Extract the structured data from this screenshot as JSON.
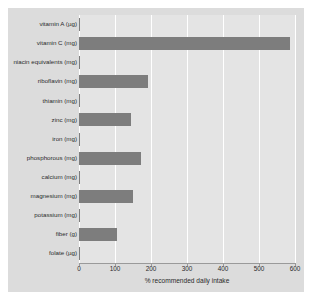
{
  "chart_data": {
    "type": "bar",
    "orientation": "horizontal",
    "title": "",
    "xlabel": "% recommended daily intake",
    "ylabel": "",
    "xlim": [
      0,
      600
    ],
    "xticks": [
      0,
      100,
      200,
      300,
      400,
      500,
      600
    ],
    "grid": true,
    "legend": null,
    "categories": [
      "vitamin A (µg)",
      "vitamin C (mg)",
      "niacin equivalents (mg)",
      "riboflavin (mg)",
      "thiamin (mg)",
      "zinc (mg)",
      "iron (mg)",
      "phosphorous (mg)",
      "calcium (mg)",
      "magnesium (mg)",
      "potassium (mg)",
      "fiber (g)",
      "folate (µg)"
    ],
    "values": [
      0,
      586,
      0,
      192,
      0,
      145,
      0,
      172,
      0,
      150,
      0,
      105,
      0
    ],
    "bar_color": "#7d7d7d",
    "plot_background": "#e4e4e4",
    "panel_background": "#dcdcdc",
    "gridline_color": "#ffffff"
  }
}
